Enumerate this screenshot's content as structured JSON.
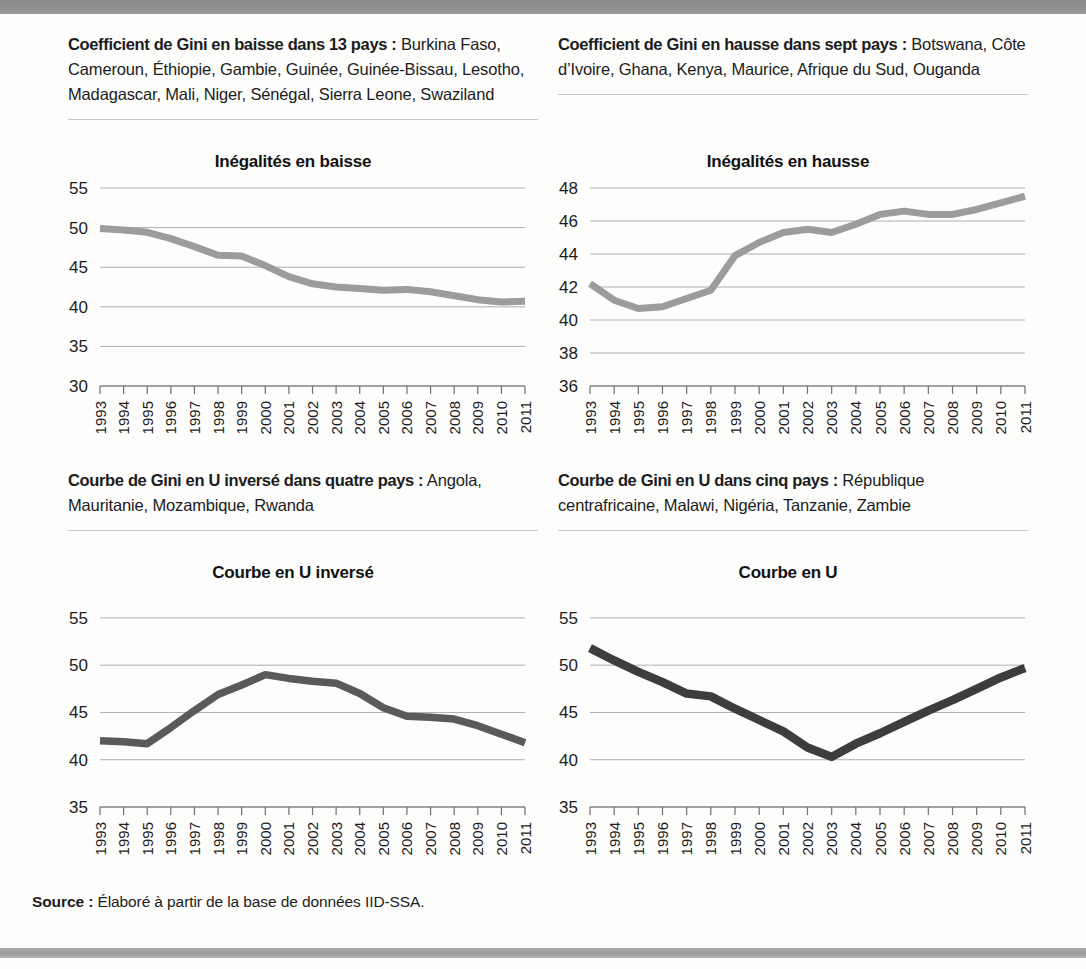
{
  "page": {
    "top_bar_ghost_text": "",
    "source_label": "Source :",
    "source_text": "Élaboré à partir de la base de données IID-SSA."
  },
  "notes": [
    {
      "lead": "Coefficient de Gini en baisse dans 13 pays :",
      "body": " Burkina Faso, Cameroun, Éthiopie, Gambie, Guinée, Guinée-Bissau, Lesotho, Madagascar, Mali, Niger, Sénégal, Sierra Leone, Swaziland"
    },
    {
      "lead": "Coefficient de Gini en hausse dans sept pays :",
      "body": " Botswana, Côte d’Ivoire, Ghana, Kenya, Maurice, Afrique du Sud, Ouganda"
    },
    {
      "lead": "Courbe de Gini en U inversé dans quatre pays :",
      "body": " Angola, Mauritanie, Mozambique, Rwanda"
    },
    {
      "lead": "Courbe de Gini en U dans cinq pays :",
      "body": " République centrafricaine, Malawi, Nigéria, Tanzanie, Zambie"
    }
  ],
  "chart_data": [
    {
      "type": "line",
      "id": "inegalites-en-baisse",
      "title": "Inégalités en baisse",
      "xlabel": "",
      "ylabel": "",
      "categories": [
        "1993",
        "1994",
        "1995",
        "1996",
        "1997",
        "1998",
        "1999",
        "2000",
        "2001",
        "2002",
        "2003",
        "2004",
        "2005",
        "2006",
        "2007",
        "2008",
        "2009",
        "2010",
        "2011"
      ],
      "values": [
        49.9,
        49.7,
        49.4,
        48.6,
        47.6,
        46.5,
        46.4,
        45.2,
        43.8,
        42.9,
        42.5,
        42.3,
        42.1,
        42.2,
        41.9,
        41.4,
        40.9,
        40.6,
        40.7
      ],
      "ylim": [
        30,
        55
      ],
      "yticks": [
        30,
        35,
        40,
        45,
        50,
        55
      ],
      "grid": true,
      "legend": "none",
      "line_color": "#9c9c9c"
    },
    {
      "type": "line",
      "id": "inegalites-en-hausse",
      "title": "Inégalités en hausse",
      "xlabel": "",
      "ylabel": "",
      "categories": [
        "1993",
        "1994",
        "1995",
        "1996",
        "1997",
        "1998",
        "1999",
        "2000",
        "2001",
        "2002",
        "2003",
        "2004",
        "2005",
        "2006",
        "2007",
        "2008",
        "2009",
        "2010",
        "2011"
      ],
      "values": [
        42.2,
        41.2,
        40.7,
        40.8,
        41.3,
        41.8,
        43.9,
        44.7,
        45.3,
        45.5,
        45.3,
        45.8,
        46.4,
        46.6,
        46.4,
        46.4,
        46.7,
        47.1,
        47.5
      ],
      "ylim": [
        36,
        48
      ],
      "yticks": [
        36,
        38,
        40,
        42,
        44,
        46,
        48
      ],
      "grid": true,
      "legend": "none",
      "line_color": "#9c9c9c"
    },
    {
      "type": "line",
      "id": "courbe-en-u-inverse",
      "title": "Courbe en U inversé",
      "xlabel": "",
      "ylabel": "",
      "categories": [
        "1993",
        "1994",
        "1995",
        "1996",
        "1997",
        "1998",
        "1999",
        "2000",
        "2001",
        "2002",
        "2003",
        "2004",
        "2005",
        "2006",
        "2007",
        "2008",
        "2009",
        "2010",
        "2011"
      ],
      "values": [
        42.0,
        41.9,
        41.7,
        43.4,
        45.2,
        46.9,
        47.9,
        49.0,
        48.6,
        48.3,
        48.1,
        47.0,
        45.5,
        44.6,
        44.5,
        44.3,
        43.6,
        42.7,
        41.8
      ],
      "ylim": [
        35,
        57
      ],
      "yticks": [
        35,
        40,
        45,
        50,
        55
      ],
      "grid": true,
      "legend": "none",
      "line_color": "#5a5a5a"
    },
    {
      "type": "line",
      "id": "courbe-en-u",
      "title": "Courbe en U",
      "xlabel": "",
      "ylabel": "",
      "categories": [
        "1993",
        "1994",
        "1995",
        "1996",
        "1997",
        "1998",
        "1999",
        "2000",
        "2001",
        "2002",
        "2003",
        "2004",
        "2005",
        "2006",
        "2007",
        "2008",
        "2009",
        "2010",
        "2011"
      ],
      "values": [
        51.8,
        50.5,
        49.3,
        48.2,
        47.0,
        46.7,
        45.4,
        44.2,
        43.0,
        41.3,
        40.3,
        41.7,
        42.8,
        44.0,
        45.2,
        46.3,
        47.5,
        48.7,
        49.7
      ],
      "ylim": [
        35,
        57
      ],
      "yticks": [
        35,
        40,
        45,
        50,
        55
      ],
      "grid": true,
      "legend": "none",
      "line_color": "#3d3d3d"
    }
  ]
}
